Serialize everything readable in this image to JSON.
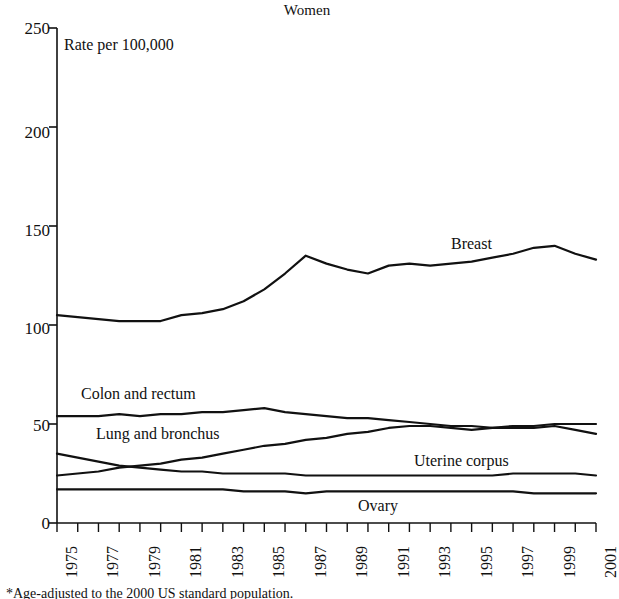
{
  "chart_data": {
    "type": "line",
    "title": "Women",
    "subtitle": "Rate per 100,000",
    "xlabel": "",
    "ylabel": "Rate per 100,000",
    "ylim": [
      0,
      250
    ],
    "ytick_values": [
      0,
      50,
      100,
      150,
      200,
      250
    ],
    "ytick_labels": [
      "0",
      "50",
      "100",
      "150",
      "200",
      "250"
    ],
    "grid": false,
    "legend_position": "inline-labels",
    "x": [
      1975,
      1976,
      1977,
      1978,
      1979,
      1980,
      1981,
      1982,
      1983,
      1984,
      1985,
      1986,
      1987,
      1988,
      1989,
      1990,
      1991,
      1992,
      1993,
      1994,
      1995,
      1996,
      1997,
      1998,
      1999,
      2000,
      2001
    ],
    "xtick_labels": [
      "1975",
      "1977",
      "1979",
      "1981",
      "1983",
      "1985",
      "1987",
      "1989",
      "1991",
      "1993",
      "1995",
      "1997",
      "1999",
      "2001"
    ],
    "xlim": [
      1975,
      2001
    ],
    "series": [
      {
        "name": "Breast",
        "label": "Breast",
        "values": [
          105,
          104,
          103,
          102,
          102,
          102,
          105,
          106,
          108,
          112,
          118,
          126,
          135,
          131,
          128,
          126,
          130,
          131,
          130,
          131,
          132,
          134,
          136,
          139,
          140,
          136,
          133
        ]
      },
      {
        "name": "Colon and rectum",
        "label": "Colon and rectum",
        "values": [
          54,
          54,
          54,
          55,
          54,
          55,
          55,
          56,
          56,
          57,
          58,
          56,
          55,
          54,
          53,
          53,
          52,
          51,
          50,
          49,
          49,
          48,
          48,
          48,
          49,
          47,
          45
        ]
      },
      {
        "name": "Lung and bronchus",
        "label": "Lung and bronchus",
        "values": [
          24,
          25,
          26,
          28,
          29,
          30,
          32,
          33,
          35,
          37,
          39,
          40,
          42,
          43,
          45,
          46,
          48,
          49,
          49,
          48,
          47,
          48,
          49,
          49,
          50,
          50,
          50
        ]
      },
      {
        "name": "Uterine corpus",
        "label": "Uterine corpus",
        "values": [
          35,
          33,
          31,
          29,
          28,
          27,
          26,
          26,
          25,
          25,
          25,
          25,
          24,
          24,
          24,
          24,
          24,
          24,
          24,
          24,
          24,
          24,
          25,
          25,
          25,
          25,
          24
        ]
      },
      {
        "name": "Ovary",
        "label": "Ovary",
        "values": [
          17,
          17,
          17,
          17,
          17,
          17,
          17,
          17,
          17,
          16,
          16,
          16,
          15,
          16,
          16,
          16,
          16,
          16,
          16,
          16,
          16,
          16,
          16,
          15,
          15,
          15,
          15
        ]
      }
    ],
    "annotations": [
      {
        "text": "Breast",
        "x": 1991,
        "y": 146
      },
      {
        "text": "Colon and rectum",
        "x": 1977,
        "y": 66
      },
      {
        "text": "Lung and bronchus",
        "x": 1979,
        "y": 49
      },
      {
        "text": "Uterine corpus",
        "x": 1993,
        "y": 33
      },
      {
        "text": "Ovary",
        "x": 1990,
        "y": 10
      }
    ],
    "line_color": "#111111"
  },
  "bottom_caption": {
    "text": "*Age-adjusted to the 2000 US standard population."
  }
}
